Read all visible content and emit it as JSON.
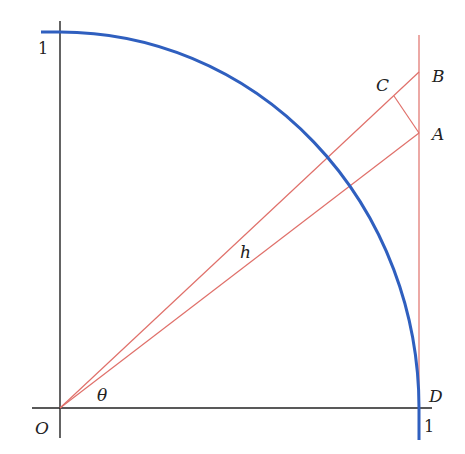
{
  "diagram": {
    "type": "geometry",
    "colors": {
      "axes": "#222222",
      "arc": "#2f5fbf",
      "construction": "#e0706a"
    },
    "labels": {
      "origin": "O",
      "theta": "θ",
      "h": "h",
      "A": "A",
      "B": "B",
      "C": "C",
      "D": "D",
      "y_tick": "1",
      "x_tick": "1"
    }
  }
}
